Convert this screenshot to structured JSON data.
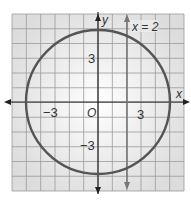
{
  "figure": {
    "grid": {
      "xmin": -6,
      "xmax": 6,
      "ymin": -6,
      "ymax": 6,
      "step": 1
    },
    "axes": {
      "x_label": "x",
      "y_label": "y",
      "origin_label": "O"
    },
    "ticks": {
      "x_neg": "−3",
      "x_pos": "3",
      "y_pos": "3",
      "y_neg": "−3"
    },
    "circle": {
      "cx": 0,
      "cy": 0,
      "r": 5
    },
    "line": {
      "label": "x = 2",
      "x": 2
    },
    "colors": {
      "grid": "#9a9a9a",
      "background": "#e8e8e8",
      "axis": "#222222",
      "circle": "#555555",
      "line": "#777777"
    }
  }
}
